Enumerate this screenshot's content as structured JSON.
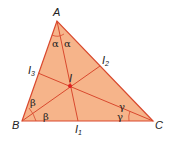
{
  "diagram": {
    "colors": {
      "fill": "#f6b48a",
      "stroke": "#d9492e",
      "incenter": "#e02020",
      "text": "#222222"
    },
    "vertices": [
      {
        "id": "A",
        "label": "A",
        "x": 57,
        "y": 21
      },
      {
        "id": "B",
        "label": "B",
        "x": 22,
        "y": 121
      },
      {
        "id": "C",
        "label": "C",
        "x": 153,
        "y": 121
      }
    ],
    "incenter": {
      "label": "I",
      "x": 70,
      "y": 86
    },
    "feet": [
      {
        "label": "I",
        "subscript": "1",
        "x": 78,
        "y": 121
      },
      {
        "label": "I",
        "subscript": "2",
        "x": 100,
        "y": 66
      },
      {
        "label": "I",
        "subscript": "3",
        "x": 38,
        "y": 73
      }
    ],
    "angle_labels": {
      "A": "α",
      "B": "β",
      "C": "γ"
    }
  }
}
